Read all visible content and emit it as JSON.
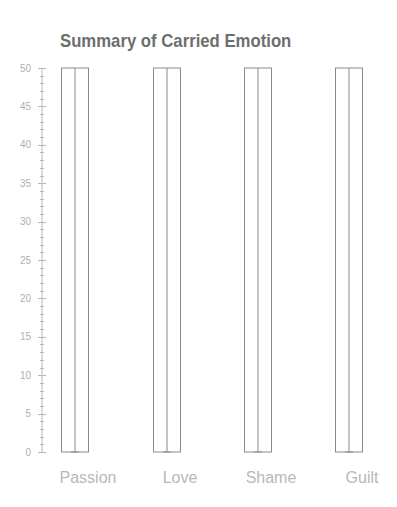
{
  "chart_data": {
    "type": "bar",
    "title": "Summary of Carried Emotion",
    "categories": [
      "Passion",
      "Love",
      "Shame",
      "Guilt"
    ],
    "values": [
      50,
      50,
      50,
      50
    ],
    "error_bars": {
      "low": [
        0,
        0,
        0,
        0
      ],
      "high": [
        50,
        50,
        50,
        50
      ]
    },
    "xlabel": "",
    "ylabel": "",
    "ylim": [
      0,
      50
    ],
    "yticks": [
      0,
      5,
      10,
      15,
      20,
      25,
      30,
      35,
      40,
      45,
      50
    ],
    "minor_tick_step": 1,
    "grid": false,
    "legend": null,
    "style": {
      "bar_fill": "none",
      "bar_stroke": "#8a8a8a",
      "title_color": "#6e6e6e",
      "tick_label_color": "#b0b0b0",
      "category_label_color": "#b8b8b8"
    }
  }
}
